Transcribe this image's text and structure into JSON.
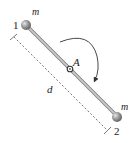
{
  "diagram": {
    "labels": {
      "mass_1_number": "1",
      "mass_2_number": "2",
      "mass_1_symbol": "m",
      "mass_2_symbol": "m",
      "pivot": "A",
      "distance": "d"
    },
    "colors": {
      "rod": "#b8b8b8",
      "rod_edge": "#7a7a7a",
      "mass": "#8c8c8c",
      "text": "#222222",
      "dashed": "#555555"
    },
    "rotation_direction": "clockwise"
  }
}
